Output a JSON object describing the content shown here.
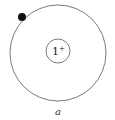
{
  "diagram": {
    "nucleus": {
      "label": "1",
      "charge_sign": "+",
      "cx": 58,
      "cy": 51,
      "r": 12
    },
    "orbit": {
      "cx": 58,
      "cy": 53,
      "r": 48
    },
    "electron": {
      "cx": 22,
      "cy": 17,
      "r": 4
    },
    "caption": "a",
    "colors": {
      "stroke": "#6b6b6b",
      "electron": "#111111",
      "background": "#ffffff"
    }
  }
}
